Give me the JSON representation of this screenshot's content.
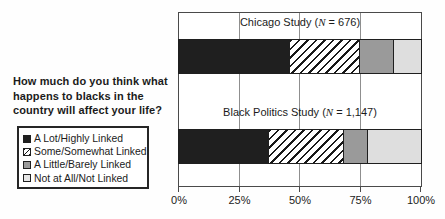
{
  "chart_data": {
    "type": "bar",
    "stacked": true,
    "orientation": "horizontal",
    "question": "How much do you think what happens to blacks in the country will affect your life?",
    "question_lines": [
      "How much do you think what",
      "happens to blacks in the",
      "country will affect your life?"
    ],
    "groups": [
      {
        "label": "Chicago Study (N = 676)",
        "label_pre": "Chicago Study (",
        "label_n": "N",
        "label_post": " = 676)"
      },
      {
        "label": "Black Politics Study (N = 1,147)",
        "label_pre": "Black Politics Study (",
        "label_n": "N",
        "label_post": " = 1,147)"
      }
    ],
    "series": [
      {
        "name": "A Lot/Highly Linked",
        "swatch": "black",
        "values": [
          46,
          37
        ]
      },
      {
        "name": "Some/Somewhat Linked",
        "swatch": "hatched",
        "values": [
          29,
          31
        ]
      },
      {
        "name": "A Little/Barely Linked",
        "swatch": "gray",
        "values": [
          14,
          10
        ]
      },
      {
        "name": "Not at All/Not Linked",
        "swatch": "lightgray",
        "values": [
          11,
          22
        ]
      }
    ],
    "xlim": [
      0,
      100
    ],
    "xticks": [
      {
        "value": 0,
        "label": "0%"
      },
      {
        "value": 25,
        "label": "25%"
      },
      {
        "value": 50,
        "label": "50%"
      },
      {
        "value": 75,
        "label": "75%"
      },
      {
        "value": 100,
        "label": "100%"
      }
    ],
    "gridlines": [
      25,
      50,
      75
    ],
    "legend_position": "left-bottom",
    "grid": "vertical-only"
  },
  "colors": {
    "segment_black": "#1f1f1f",
    "segment_gray": "#9a9a9a",
    "segment_lightgray": "#dedede",
    "hatch_stripe": "#181818",
    "hatch_background": "#ffffff",
    "gridline": "#8f8f8f",
    "plot_border": "#4a4a4a",
    "text": "#1b1b1b",
    "background": "#ffffff"
  }
}
